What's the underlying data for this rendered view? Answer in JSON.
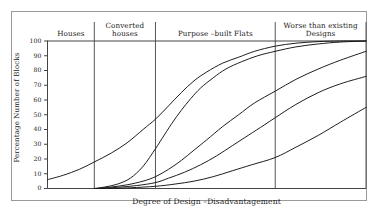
{
  "chart_data": {
    "type": "line",
    "title": "",
    "xlabel": "Degree of Design –Disadvantagement",
    "ylabel": "Percentage Number of Blocks",
    "ylim": [
      0,
      100
    ],
    "xlim": [
      0,
      100
    ],
    "grid": false,
    "legend_position": "none",
    "yticks": [
      "100",
      "90",
      "80",
      "70",
      "60",
      "50",
      "40",
      "30",
      "20",
      "10",
      "0"
    ],
    "ytick_values": [
      100,
      90,
      80,
      70,
      60,
      50,
      40,
      30,
      20,
      10,
      0
    ],
    "xticks": [],
    "band_labels": [
      {
        "label_line1": "Houses",
        "label_line2": "",
        "x_start": 0,
        "x_end": 14.7
      },
      {
        "label_line1": "Converted",
        "label_line2": "houses",
        "x_start": 14.7,
        "x_end": 33.9
      },
      {
        "label_line1": "Purpose –built Flats",
        "label_line2": "",
        "x_start": 33.9,
        "x_end": 71.5
      },
      {
        "label_line1": "Worse than existing",
        "label_line2": "Designs",
        "x_start": 71.5,
        "x_end": 100
      }
    ],
    "band_dividers": [
      14.7,
      33.9,
      71.5
    ],
    "series": [
      {
        "name": "curve-1",
        "points": [
          [
            0,
            6
          ],
          [
            5,
            9
          ],
          [
            10,
            13
          ],
          [
            14.7,
            18
          ],
          [
            20,
            24
          ],
          [
            25,
            31
          ],
          [
            30,
            40
          ],
          [
            33.9,
            47
          ],
          [
            38,
            56
          ],
          [
            42,
            65
          ],
          [
            46,
            73
          ],
          [
            50,
            79
          ],
          [
            55,
            85
          ],
          [
            60,
            89
          ],
          [
            65,
            93
          ],
          [
            71.5,
            96.5
          ],
          [
            78,
            98.5
          ],
          [
            85,
            99.6
          ],
          [
            92,
            100
          ],
          [
            100,
            100
          ]
        ]
      },
      {
        "name": "curve-2",
        "points": [
          [
            14.7,
            0
          ],
          [
            18,
            1
          ],
          [
            22,
            3
          ],
          [
            26,
            7
          ],
          [
            30,
            15
          ],
          [
            33.9,
            27
          ],
          [
            36,
            34
          ],
          [
            39,
            44
          ],
          [
            42,
            53
          ],
          [
            45,
            61
          ],
          [
            48,
            68
          ],
          [
            52,
            75
          ],
          [
            56,
            81
          ],
          [
            61,
            86
          ],
          [
            66,
            90
          ],
          [
            71.5,
            93
          ],
          [
            78,
            96
          ],
          [
            85,
            98
          ],
          [
            92,
            99.3
          ],
          [
            100,
            100
          ]
        ]
      },
      {
        "name": "curve-3",
        "points": [
          [
            15.5,
            0
          ],
          [
            20,
            1
          ],
          [
            25,
            2.5
          ],
          [
            30,
            5
          ],
          [
            33.9,
            8
          ],
          [
            38,
            13
          ],
          [
            42,
            19
          ],
          [
            46,
            26
          ],
          [
            50,
            33
          ],
          [
            55,
            42
          ],
          [
            60,
            50
          ],
          [
            65,
            58
          ],
          [
            71.5,
            66
          ],
          [
            78,
            74
          ],
          [
            85,
            81
          ],
          [
            92,
            87
          ],
          [
            100,
            93
          ]
        ]
      },
      {
        "name": "curve-4",
        "points": [
          [
            16.5,
            0
          ],
          [
            22,
            0.8
          ],
          [
            28,
            2
          ],
          [
            33.9,
            4
          ],
          [
            38,
            7
          ],
          [
            43,
            11
          ],
          [
            48,
            16
          ],
          [
            53,
            22
          ],
          [
            58,
            29
          ],
          [
            63,
            36
          ],
          [
            68,
            43
          ],
          [
            71.5,
            48
          ],
          [
            78,
            57
          ],
          [
            85,
            65
          ],
          [
            92,
            71
          ],
          [
            100,
            76
          ]
        ]
      },
      {
        "name": "curve-5",
        "points": [
          [
            19,
            0
          ],
          [
            26,
            0.5
          ],
          [
            33.9,
            1.5
          ],
          [
            40,
            3
          ],
          [
            46,
            5
          ],
          [
            52,
            8
          ],
          [
            58,
            12
          ],
          [
            64,
            16
          ],
          [
            71.5,
            21
          ],
          [
            78,
            28
          ],
          [
            85,
            36
          ],
          [
            92,
            45
          ],
          [
            100,
            55
          ]
        ]
      }
    ]
  },
  "figure": {
    "frame_color": "#9a9a9a",
    "line_color": "#121212",
    "axis_color": "#444444",
    "background": "#ffffff"
  }
}
